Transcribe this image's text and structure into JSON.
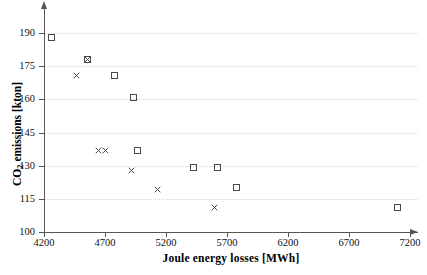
{
  "chart_data": {
    "type": "scatter",
    "title": "",
    "xlabel": "Joule energy losses [MWh]",
    "ylabel": "CO2 emissions [kton]",
    "ylabel_prefix": "CO",
    "ylabel_sub": "2",
    "ylabel_suffix": " emissions [kton]",
    "xlim": [
      4200,
      7200
    ],
    "ylim": [
      100,
      190
    ],
    "xticks": [
      4200,
      4700,
      5200,
      5700,
      6200,
      6700,
      7200
    ],
    "yticks": [
      100,
      115,
      130,
      145,
      160,
      175,
      190
    ],
    "xtick_labels": [
      "4200",
      "4700",
      "5200",
      "5700",
      "6200",
      "6700",
      "7200"
    ],
    "ytick_labels": [
      "100",
      "115",
      "130",
      "145",
      "160",
      "175",
      "190"
    ],
    "grid": true,
    "grid_axis": "y",
    "legend": false,
    "marker_color": "#4a4a4a",
    "series": [
      {
        "name": "squares",
        "marker": "square",
        "points": [
          [
            4260,
            188
          ],
          [
            4560,
            178
          ],
          [
            4775,
            171
          ],
          [
            4930,
            161
          ],
          [
            4965,
            137
          ],
          [
            5425,
            129
          ],
          [
            5620,
            129
          ],
          [
            5775,
            120
          ],
          [
            7100,
            111
          ]
        ]
      },
      {
        "name": "crosses",
        "marker": "x",
        "points": [
          [
            4560,
            178
          ],
          [
            4470,
            171
          ],
          [
            4650,
            137
          ],
          [
            4700,
            137
          ],
          [
            4920,
            128
          ],
          [
            5130,
            119
          ],
          [
            5600,
            111
          ]
        ]
      }
    ]
  }
}
